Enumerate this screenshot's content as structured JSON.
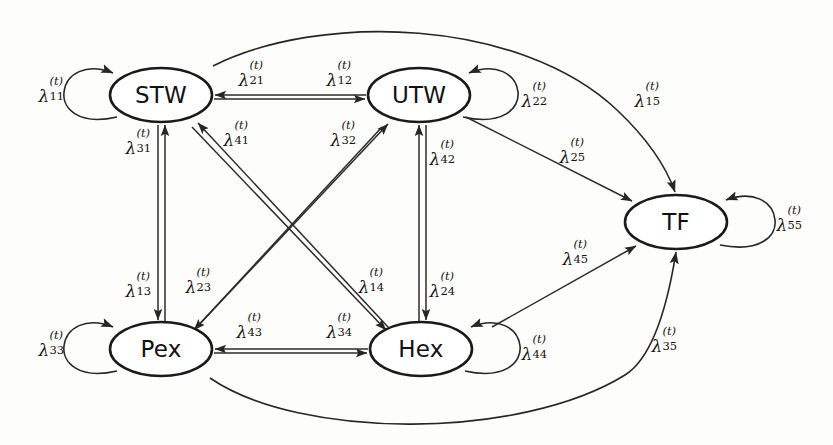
{
  "diagram": {
    "background": "#fdfdfb",
    "stroke_color": "#1a1a1a",
    "nodes": [
      {
        "id": "STW",
        "label": "STW",
        "cx": 161,
        "cy": 95,
        "rx": 51,
        "ry": 27
      },
      {
        "id": "UTW",
        "label": "UTW",
        "cx": 419,
        "cy": 95,
        "rx": 51,
        "ry": 27
      },
      {
        "id": "TF",
        "label": "TF",
        "cx": 676,
        "cy": 222,
        "rx": 51,
        "ry": 27
      },
      {
        "id": "Pex",
        "label": "Pex",
        "cx": 161,
        "cy": 349,
        "rx": 51,
        "ry": 27
      },
      {
        "id": "Hex",
        "label": "Hex",
        "cx": 421,
        "cy": 349,
        "rx": 51,
        "ry": 27
      }
    ],
    "labels": [
      {
        "name": "lambda-11",
        "sym": "λ",
        "sup": "(t)",
        "sub": "11",
        "x": 52,
        "y": 95,
        "from": "STW",
        "to": "STW"
      },
      {
        "name": "lambda-21",
        "sym": "λ",
        "sup": "(t)",
        "sub": "21",
        "x": 252,
        "y": 79,
        "from": "UTW",
        "to": "STW"
      },
      {
        "name": "lambda-12",
        "sym": "λ",
        "sup": "(t)",
        "sub": "12",
        "x": 340,
        "y": 79,
        "from": "STW",
        "to": "UTW"
      },
      {
        "name": "lambda-22",
        "sym": "λ",
        "sup": "(t)",
        "sub": "22",
        "x": 535,
        "y": 100,
        "from": "UTW",
        "to": "UTW"
      },
      {
        "name": "lambda-15",
        "sym": "λ",
        "sup": "(t)",
        "sub": "15",
        "x": 648,
        "y": 100,
        "from": "STW",
        "to": "TF"
      },
      {
        "name": "lambda-31",
        "sym": "λ",
        "sup": "(t)",
        "sub": "31",
        "x": 139,
        "y": 147,
        "from": "Pex",
        "to": "STW"
      },
      {
        "name": "lambda-41",
        "sym": "λ",
        "sup": "(t)",
        "sub": "41",
        "x": 237,
        "y": 139,
        "from": "Hex",
        "to": "STW"
      },
      {
        "name": "lambda-32",
        "sym": "λ",
        "sup": "(t)",
        "sub": "32",
        "x": 344,
        "y": 139,
        "from": "Pex",
        "to": "UTW"
      },
      {
        "name": "lambda-42",
        "sym": "λ",
        "sup": "(t)",
        "sub": "42",
        "x": 443,
        "y": 158,
        "from": "Hex",
        "to": "UTW"
      },
      {
        "name": "lambda-25",
        "sym": "λ",
        "sup": "(t)",
        "sub": "25",
        "x": 573,
        "y": 156,
        "from": "UTW",
        "to": "TF"
      },
      {
        "name": "lambda-55",
        "sym": "λ",
        "sup": "(t)",
        "sub": "55",
        "x": 790,
        "y": 224,
        "from": "TF",
        "to": "TF"
      },
      {
        "name": "lambda-45",
        "sym": "λ",
        "sup": "(t)",
        "sub": "45",
        "x": 576,
        "y": 258,
        "from": "Hex",
        "to": "TF"
      },
      {
        "name": "lambda-13",
        "sym": "λ",
        "sup": "(t)",
        "sub": "13",
        "x": 139,
        "y": 290,
        "from": "STW",
        "to": "Pex"
      },
      {
        "name": "lambda-23",
        "sym": "λ",
        "sup": "(t)",
        "sub": "23",
        "x": 199,
        "y": 286,
        "from": "UTW",
        "to": "Pex"
      },
      {
        "name": "lambda-14",
        "sym": "λ",
        "sup": "(t)",
        "sub": "14",
        "x": 372,
        "y": 286,
        "from": "STW",
        "to": "Hex"
      },
      {
        "name": "lambda-24",
        "sym": "λ",
        "sup": "(t)",
        "sub": "24",
        "x": 443,
        "y": 290,
        "from": "UTW",
        "to": "Hex"
      },
      {
        "name": "lambda-33",
        "sym": "λ",
        "sup": "(t)",
        "sub": "33",
        "x": 52,
        "y": 349,
        "from": "Pex",
        "to": "Pex"
      },
      {
        "name": "lambda-43",
        "sym": "λ",
        "sup": "(t)",
        "sub": "43",
        "x": 250,
        "y": 331,
        "from": "Hex",
        "to": "Pex"
      },
      {
        "name": "lambda-34",
        "sym": "λ",
        "sup": "(t)",
        "sub": "34",
        "x": 340,
        "y": 331,
        "from": "Pex",
        "to": "Hex"
      },
      {
        "name": "lambda-44",
        "sym": "λ",
        "sup": "(t)",
        "sub": "44",
        "x": 535,
        "y": 353,
        "from": "Hex",
        "to": "Hex"
      },
      {
        "name": "lambda-35",
        "sym": "λ",
        "sup": "(t)",
        "sub": "35",
        "x": 665,
        "y": 345,
        "from": "Pex",
        "to": "TF"
      }
    ]
  }
}
